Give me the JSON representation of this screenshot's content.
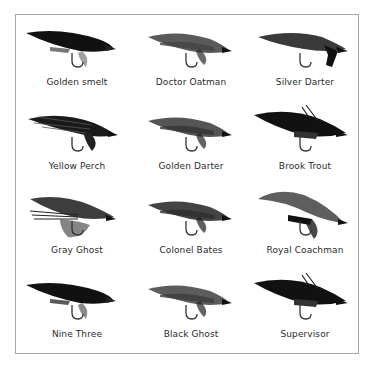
{
  "flies": [
    {
      "name": "Golden smelt",
      "shade": "#1a1a1a",
      "wing": "#111111",
      "accent": "#777777",
      "style": "long"
    },
    {
      "name": "Doctor Oatman",
      "shade": "#5a5a5a",
      "wing": "#444444",
      "accent": "#2a2a2a",
      "style": "mid"
    },
    {
      "name": "Silver Darter",
      "shade": "#3a3a3a",
      "wing": "#2a2a2a",
      "accent": "#111111",
      "style": "hackle"
    },
    {
      "name": "Yellow Perch",
      "shade": "#262626",
      "wing": "#1a1a1a",
      "accent": "#555555",
      "style": "barred"
    },
    {
      "name": "Golden Darter",
      "shade": "#555555",
      "wing": "#333333",
      "accent": "#222222",
      "style": "mid"
    },
    {
      "name": "Brook Trout",
      "shade": "#1c1c1c",
      "wing": "#111111",
      "accent": "#333333",
      "style": "bushy"
    },
    {
      "name": "Gray Ghost",
      "shade": "#3d3d3d",
      "wing": "#2b2b2b",
      "accent": "#666666",
      "style": "ghost"
    },
    {
      "name": "Colonel Bates",
      "shade": "#444444",
      "wing": "#2e2e2e",
      "accent": "#1a1a1a",
      "style": "mid"
    },
    {
      "name": "Royal Coachman",
      "shade": "#4a4a4a",
      "wing": "#5e5e5e",
      "accent": "#1a1a1a",
      "style": "arched"
    },
    {
      "name": "Nine Three",
      "shade": "#1e1e1e",
      "wing": "#111111",
      "accent": "#5a5a5a",
      "style": "long"
    },
    {
      "name": "Black Ghost",
      "shade": "#5c5c5c",
      "wing": "#3c3c3c",
      "accent": "#222222",
      "style": "mid"
    },
    {
      "name": "Supervisor",
      "shade": "#1f1f1f",
      "wing": "#111111",
      "accent": "#333333",
      "style": "bushy"
    }
  ],
  "layout": {
    "columns": 3,
    "rows": 4,
    "border_color": "#a8a8a8",
    "label_color": "#2a2a2a"
  }
}
